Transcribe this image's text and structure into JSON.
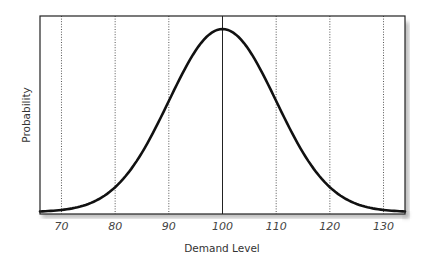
{
  "chart_data": {
    "type": "line",
    "title": "",
    "xlabel": "Demand Level",
    "ylabel": "Probability",
    "xlim": [
      66,
      134
    ],
    "ylim": [
      0,
      1
    ],
    "grid": "vertical dotted lines at ticks, solid line at mean",
    "legend": "none",
    "x_ticks": [
      70,
      80,
      90,
      100,
      110,
      120,
      130
    ],
    "x_tick_labels": [
      "70",
      "80",
      "90",
      "100",
      "110",
      "120",
      "130"
    ],
    "series": [
      {
        "name": "Normal distribution (mean 100, sd 10)",
        "distribution": "normal",
        "mean": 100,
        "sd": 10,
        "x": [
          66,
          70,
          75,
          80,
          85,
          90,
          95,
          100,
          105,
          110,
          115,
          120,
          125,
          130,
          134
        ],
        "values": [
          0.003,
          0.011,
          0.044,
          0.135,
          0.325,
          0.607,
          0.882,
          1.0,
          0.882,
          0.607,
          0.325,
          0.135,
          0.044,
          0.011,
          0.003
        ]
      }
    ],
    "annotations": [
      {
        "type": "vertical-solid-line",
        "x": 100
      }
    ]
  },
  "colors": {
    "curve": "#111111",
    "frame": "#222222",
    "grid": "#555555",
    "shadow": "#bbbbbb"
  }
}
